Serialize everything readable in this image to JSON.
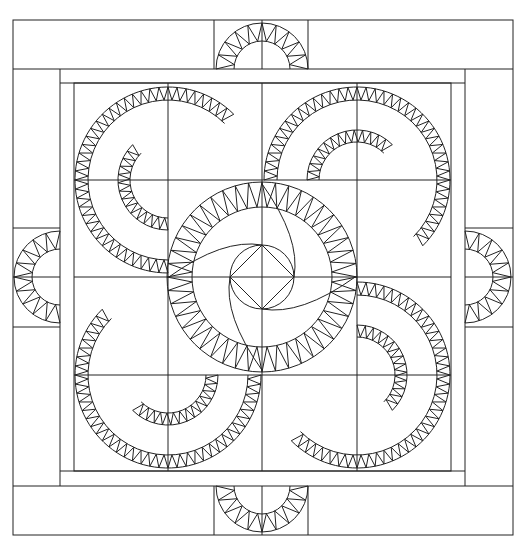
{
  "colors": {
    "background": "#ffffff",
    "line": "#222222"
  },
  "frame": {
    "outer": {
      "x1": 13,
      "y1": 20,
      "x2": 513,
      "y2": 535
    },
    "top_band_bottom": 69,
    "bottom_band_top": 486,
    "left_col_right": 60,
    "right_col_left": 465,
    "inner_strip": {
      "x1": 60,
      "y1": 69,
      "x2": 465,
      "y2": 486
    },
    "block_area": {
      "x1": 74,
      "y1": 83,
      "x2": 451,
      "y2": 471
    }
  },
  "grid": {
    "cols": [
      74,
      168,
      262,
      357,
      451
    ],
    "rows": [
      83,
      180,
      277,
      375,
      471
    ]
  },
  "border_dividers": {
    "top": [
      214,
      308
    ],
    "bottom": [
      214,
      308
    ],
    "left": [
      228,
      327
    ],
    "right": [
      228,
      327
    ]
  },
  "corner_wheels": [
    {
      "name": "top-left",
      "cx": 168,
      "cy": 180,
      "r_outer": 93,
      "r_inner": 80,
      "teeth": 40
    },
    {
      "name": "top-right",
      "cx": 357,
      "cy": 180,
      "r_outer": 93,
      "r_inner": 80,
      "teeth": 40
    },
    {
      "name": "bottom-left",
      "cx": 168,
      "cy": 375,
      "r_outer": 93,
      "r_inner": 80,
      "teeth": 40
    },
    {
      "name": "bottom-right",
      "cx": 357,
      "cy": 375,
      "r_outer": 93,
      "r_inner": 80,
      "teeth": 40
    }
  ],
  "center_wheel": {
    "cx": 262,
    "cy": 277,
    "r_outer": 95,
    "r_inner": 70,
    "r_core": 32,
    "teeth": 44
  },
  "border_halfwheels": [
    {
      "name": "top",
      "cx": 262,
      "cy": 69,
      "r_outer": 46,
      "r_inner": 28
    },
    {
      "name": "bottom",
      "cx": 262,
      "cy": 486,
      "r_outer": 46,
      "r_inner": 28
    },
    {
      "name": "left",
      "cx": 60,
      "cy": 277,
      "r_outer": 46,
      "r_inner": 28
    },
    {
      "name": "right",
      "cx": 465,
      "cy": 277,
      "r_outer": 46,
      "r_inner": 28
    }
  ]
}
